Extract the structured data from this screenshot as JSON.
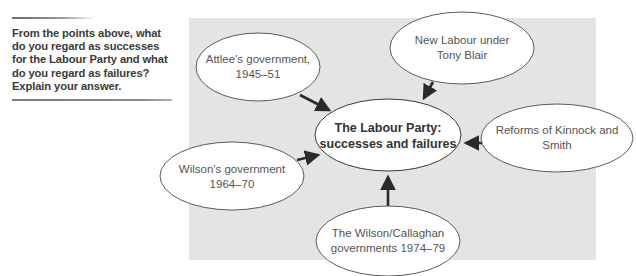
{
  "question": {
    "text": "From the points above, what do you regard as successes for the Labour Party and what do you regard as failures? Explain your answer."
  },
  "diagram": {
    "background_color": "#e4e4e4",
    "center_node": {
      "line1": "The Labour Party:",
      "line2": "successes and failures"
    },
    "nodes": [
      {
        "id": "attlee",
        "line1": "Attlee's government,",
        "line2": "1945–51"
      },
      {
        "id": "new-labour",
        "line1": "New Labour under",
        "line2": "Tony Blair"
      },
      {
        "id": "kinnock-smith",
        "line1": "Reforms of Kinnock and",
        "line2": "Smith"
      },
      {
        "id": "wilson",
        "line1": "Wilson's government",
        "line2": "1964–70"
      },
      {
        "id": "wilson-callaghan",
        "line1": "The Wilson/Callaghan",
        "line2": "governments 1974–79"
      }
    ],
    "edges": [
      {
        "from": "attlee",
        "to": "center"
      },
      {
        "from": "new-labour",
        "to": "center"
      },
      {
        "from": "kinnock-smith",
        "to": "center"
      },
      {
        "from": "wilson",
        "to": "center"
      },
      {
        "from": "wilson-callaghan",
        "to": "center"
      }
    ]
  }
}
